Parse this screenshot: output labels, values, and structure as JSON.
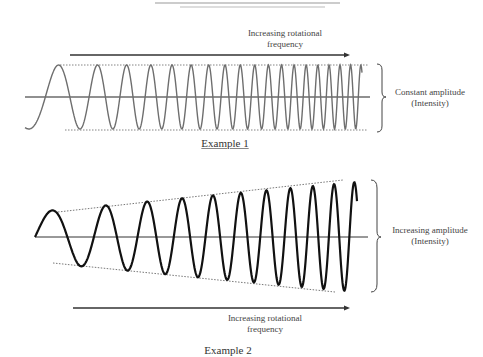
{
  "example1": {
    "caption": "Example 1",
    "arrow_label_line1": "Increasing rotational",
    "arrow_label_line2": "frequency",
    "side_label_line1": "Constant amplitude",
    "side_label_line2": "(Intensity)",
    "wave_color": "#6e6e6e",
    "amplitude": "constant"
  },
  "example2": {
    "caption": "Example 2",
    "arrow_label_line1": "Increasing rotational",
    "arrow_label_line2": "frequency",
    "side_label_line1": "Increasing amplitude",
    "side_label_line2": "(Intensity)",
    "wave_color": "#111111",
    "amplitude": "increasing"
  }
}
